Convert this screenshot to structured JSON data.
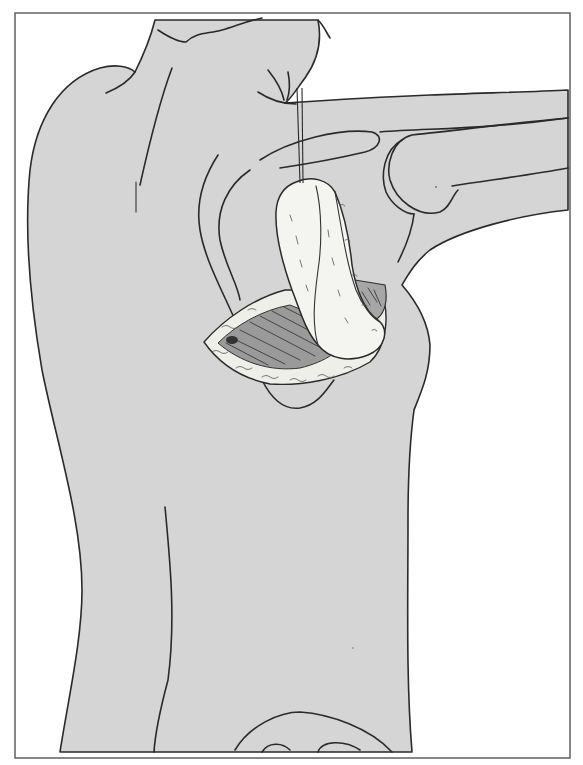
{
  "figure": {
    "labels": []
  },
  "colors": {
    "background": "#ffffff",
    "frame": "#555555",
    "skin_fill": "#d5d5d5",
    "outline": "#2a2a2a",
    "flap_fill": "#f4f4f1",
    "wound_bed": "#8f8f8f",
    "muscle_shadow": "#a6a6a6"
  },
  "frame": {
    "x": 15,
    "y": 13,
    "width": 555,
    "height": 745
  }
}
